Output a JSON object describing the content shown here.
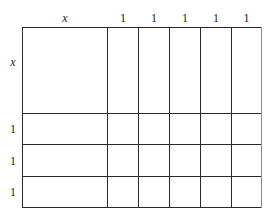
{
  "table": {
    "corner_label": "",
    "column_headers": [
      {
        "label": "x",
        "italic": true
      },
      {
        "label": "1",
        "italic": false
      },
      {
        "label": "1",
        "italic": false
      },
      {
        "label": "1",
        "italic": false
      },
      {
        "label": "1",
        "italic": false
      },
      {
        "label": "1",
        "italic": false
      }
    ],
    "row_headers": [
      {
        "label": "x",
        "italic": true
      },
      {
        "label": "1",
        "italic": false
      },
      {
        "label": "1",
        "italic": false
      },
      {
        "label": "1",
        "italic": false
      }
    ],
    "cells": [
      [
        "",
        "",
        "",
        "",
        "",
        ""
      ],
      [
        "",
        "",
        "",
        "",
        "",
        ""
      ],
      [
        "",
        "",
        "",
        "",
        "",
        ""
      ],
      [
        "",
        "",
        "",
        "",
        "",
        ""
      ]
    ],
    "colors": {
      "line": "#2a2a2a",
      "right_border": "#8a8a8a",
      "text": "#222222"
    }
  }
}
